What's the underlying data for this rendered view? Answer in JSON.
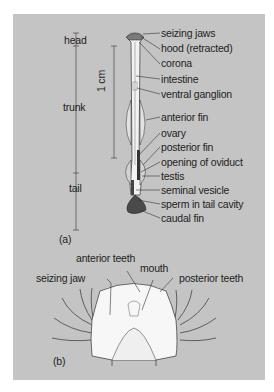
{
  "figure": {
    "panel_a": {
      "tag": "(a)",
      "regions": [
        {
          "label": "head"
        },
        {
          "label": "trunk"
        },
        {
          "label": "tail"
        }
      ],
      "scale_bar": "1 cm",
      "labels": [
        "seizing jaws",
        "hood (retracted)",
        "corona",
        "intestine",
        "ventral ganglion",
        "anterior fin",
        "ovary",
        "posterior fin",
        "opening of oviduct",
        "testis",
        "seminal vesicle",
        "sperm in tail cavity",
        "caudal fin"
      ]
    },
    "panel_b": {
      "tag": "(b)",
      "labels": {
        "anterior_teeth": "anterior teeth",
        "seizing_jaw": "seizing jaw",
        "mouth": "mouth",
        "posterior_teeth": "posterior teeth"
      }
    },
    "colors": {
      "background": "#c4c4c4",
      "line": "#2a2a2a",
      "body": "#f4f4f4"
    }
  }
}
